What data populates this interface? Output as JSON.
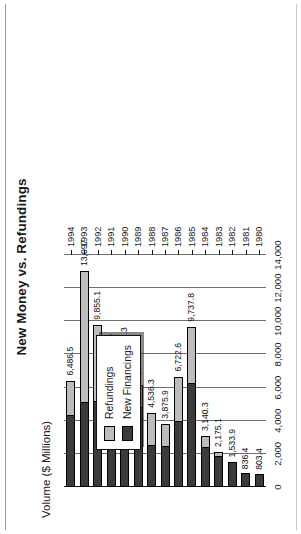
{
  "chart": {
    "title": "New Money vs. Refundings",
    "axis_title": "Volume ($ Millions)"
  },
  "legend": {
    "items": [
      {
        "label": "Refundings",
        "color": "#bdbdbd",
        "key": "refundings"
      },
      {
        "label": "New Financings",
        "color": "#3b3b3b",
        "key": "new_financings"
      }
    ]
  },
  "value_axis": {
    "ticks": [
      "0",
      "2,000",
      "4,000",
      "6,000",
      "8,000",
      "10,000",
      "12,000",
      "14,000"
    ],
    "tick_values": [
      0,
      2000,
      4000,
      6000,
      8000,
      10000,
      12000,
      14000
    ]
  },
  "value_labels": {
    "y1980": "803.4",
    "y1981": "836.4",
    "y1982": "1,533.9",
    "y1983": "2,175.1",
    "y1984": "3,140.3",
    "y1985": "9,737.8",
    "y1986": "6,722.6",
    "y1987": "3,875.9",
    "y1988": "4,536.3",
    "y1989": "6,240.3",
    "y1990": "7,677.3",
    "y1991": "7,265.9",
    "y1992": "9,855.1",
    "y1993": "13,097",
    "y1994": "6,486.5"
  },
  "categories": [
    "1980",
    "1981",
    "1982",
    "1983",
    "1984",
    "1985",
    "1986",
    "1987",
    "1988",
    "1989",
    "1990",
    "1991",
    "1992",
    "1993",
    "1994"
  ],
  "chart_data": {
    "type": "bar",
    "orientation": "vertical-stacked",
    "title": "New Money vs. Refundings",
    "xlabel": "",
    "ylabel": "Volume ($ Millions)",
    "ylim": [
      0,
      14000
    ],
    "grid": true,
    "legend_position": "inside-left",
    "categories": [
      "1980",
      "1981",
      "1982",
      "1983",
      "1984",
      "1985",
      "1986",
      "1987",
      "1988",
      "1989",
      "1990",
      "1991",
      "1992",
      "1993",
      "1994"
    ],
    "series": [
      {
        "name": "New Financings",
        "color": "#3b3b3b",
        "values": [
          803.4,
          836.4,
          1533.9,
          1850.0,
          2420.0,
          6300.0,
          4000.0,
          2500.0,
          2550.0,
          4800.0,
          5300.0,
          4450.0,
          5200.0,
          5150.0,
          4330.0
        ]
      },
      {
        "name": "Refundings",
        "color": "#bdbdbd",
        "values": [
          0.0,
          0.0,
          0.0,
          325.1,
          720.3,
          3437.8,
          2722.6,
          1375.9,
          1986.3,
          1440.3,
          2377.3,
          2815.9,
          4655.1,
          7947.0,
          2156.5
        ]
      }
    ],
    "totals": [
      803.4,
      836.4,
      1533.9,
      2175.1,
      3140.3,
      9737.8,
      6722.6,
      3875.9,
      4536.3,
      6240.3,
      7677.3,
      7265.9,
      9855.1,
      13097.0,
      6486.5
    ],
    "data_labels": [
      "803.4",
      "836.4",
      "1,533.9",
      "2,175.1",
      "3,140.3",
      "9,737.8",
      "6,722.6",
      "3,875.9",
      "4,536.3",
      "6,240.3",
      "7,677.3",
      "7,265.9",
      "9,855.1",
      "13,097",
      "6,486.5"
    ]
  }
}
